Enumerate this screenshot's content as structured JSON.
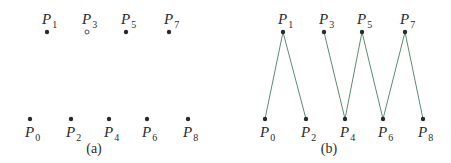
{
  "panels": [
    {
      "id": "a",
      "caption": "(a)",
      "caption_pos": [
        94,
        153
      ],
      "points": [
        {
          "name": "P",
          "sub": "0",
          "x": 30,
          "y": 119,
          "filled": true,
          "label_pos": "below"
        },
        {
          "name": "P",
          "sub": "1",
          "x": 47,
          "y": 32,
          "filled": true,
          "label_pos": "above"
        },
        {
          "name": "P",
          "sub": "2",
          "x": 71,
          "y": 119,
          "filled": true,
          "label_pos": "below"
        },
        {
          "name": "P",
          "sub": "3",
          "x": 87,
          "y": 32,
          "filled": false,
          "label_pos": "above"
        },
        {
          "name": "P",
          "sub": "4",
          "x": 109,
          "y": 119,
          "filled": true,
          "label_pos": "below"
        },
        {
          "name": "P",
          "sub": "5",
          "x": 126,
          "y": 32,
          "filled": true,
          "label_pos": "above"
        },
        {
          "name": "P",
          "sub": "6",
          "x": 147,
          "y": 119,
          "filled": true,
          "label_pos": "below"
        },
        {
          "name": "P",
          "sub": "7",
          "x": 169,
          "y": 32,
          "filled": true,
          "label_pos": "above"
        },
        {
          "name": "P",
          "sub": "8",
          "x": 188,
          "y": 119,
          "filled": true,
          "label_pos": "below"
        }
      ],
      "edges": []
    },
    {
      "id": "b",
      "caption": "(b)",
      "caption_pos": [
        329,
        153
      ],
      "points": [
        {
          "name": "P",
          "sub": "0",
          "x": 265,
          "y": 119,
          "filled": true,
          "label_pos": "below"
        },
        {
          "name": "P",
          "sub": "1",
          "x": 283,
          "y": 32,
          "filled": true,
          "label_pos": "above"
        },
        {
          "name": "P",
          "sub": "2",
          "x": 306,
          "y": 119,
          "filled": true,
          "label_pos": "below"
        },
        {
          "name": "P",
          "sub": "3",
          "x": 324,
          "y": 32,
          "filled": true,
          "label_pos": "above"
        },
        {
          "name": "P",
          "sub": "4",
          "x": 345,
          "y": 119,
          "filled": true,
          "label_pos": "below"
        },
        {
          "name": "P",
          "sub": "5",
          "x": 362,
          "y": 32,
          "filled": true,
          "label_pos": "above"
        },
        {
          "name": "P",
          "sub": "6",
          "x": 383,
          "y": 119,
          "filled": true,
          "label_pos": "below"
        },
        {
          "name": "P",
          "sub": "7",
          "x": 405,
          "y": 32,
          "filled": true,
          "label_pos": "above"
        },
        {
          "name": "P",
          "sub": "8",
          "x": 423,
          "y": 119,
          "filled": true,
          "label_pos": "below"
        }
      ],
      "edges": [
        [
          0,
          1
        ],
        [
          1,
          2
        ],
        [
          3,
          4
        ],
        [
          4,
          5
        ],
        [
          5,
          6
        ],
        [
          6,
          7
        ],
        [
          7,
          8
        ]
      ]
    }
  ],
  "colors": {
    "point": "#2a2a2a",
    "edge": "#5e8a72",
    "text": "#2a2a2a"
  }
}
